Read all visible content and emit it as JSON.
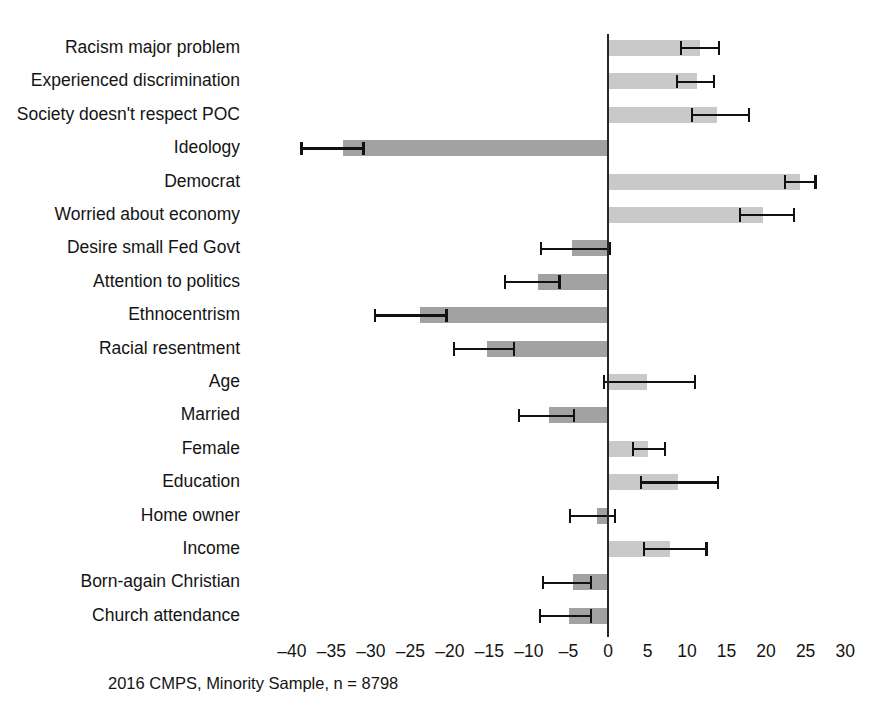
{
  "chart_data": {
    "type": "bar",
    "orientation": "horizontal",
    "title": "",
    "subtitle": "",
    "xlabel": "",
    "ylabel": "",
    "caption": "2016 CMPS, Minority Sample, n = 8798",
    "xlim": [
      -42,
      32
    ],
    "xticks": [
      -40,
      -35,
      -30,
      -25,
      -20,
      -15,
      -10,
      -5,
      0,
      5,
      10,
      15,
      20,
      25,
      30
    ],
    "xtick_labels": [
      "–40",
      "–35",
      "–30",
      "–25",
      "–20",
      "–15",
      "–10",
      "–5",
      "0",
      "5",
      "10",
      "15",
      "20",
      "25",
      "30"
    ],
    "grid": false,
    "legend": "none",
    "zero_reference_line": true,
    "error_bars": "95% confidence interval",
    "categories": [
      "Racism major problem",
      "Experienced discrimination",
      "Society doesn't respect POC",
      "Ideology",
      "Democrat",
      "Worried about economy",
      "Desire small Fed Govt",
      "Attention to politics",
      "Ethnocentrism",
      "Racial resentment",
      "Age",
      "Married",
      "Female",
      "Education",
      "Home owner",
      "Income",
      "Born-again Christian",
      "Church attendance"
    ],
    "values": [
      11.6,
      11.3,
      13.8,
      -33.5,
      24.3,
      19.6,
      -4.6,
      -8.9,
      -23.8,
      -15.3,
      4.9,
      -7.5,
      5.1,
      8.9,
      -1.4,
      7.8,
      -4.4,
      -4.9
    ],
    "ci_low": [
      9.1,
      8.6,
      10.5,
      -38.9,
      22.3,
      16.6,
      -8.6,
      -13.2,
      -29.6,
      -19.6,
      -0.6,
      -11.4,
      3.0,
      4.0,
      -4.9,
      4.4,
      -8.4,
      -8.7
    ],
    "ci_high": [
      14.2,
      13.6,
      18.0,
      -30.8,
      26.4,
      23.7,
      0.4,
      -6.0,
      -20.3,
      -11.7,
      11.1,
      -4.2,
      7.4,
      14.1,
      1.0,
      12.6,
      -2.0,
      -2.0
    ],
    "bar_colors": [
      "#c9c9c9",
      "#c9c9c9",
      "#c9c9c9",
      "#a2a2a2",
      "#c9c9c9",
      "#c9c9c9",
      "#a2a2a2",
      "#a2a2a2",
      "#a2a2a2",
      "#a2a2a2",
      "#c9c9c9",
      "#a2a2a2",
      "#c9c9c9",
      "#c9c9c9",
      "#a2a2a2",
      "#c9c9c9",
      "#a2a2a2",
      "#a2a2a2"
    ],
    "error_bar_color": "#111111",
    "axis_color": "#262626"
  }
}
